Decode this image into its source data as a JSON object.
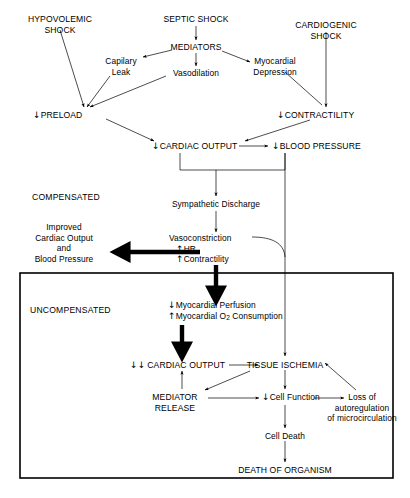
{
  "diagram": {
    "type": "flowchart",
    "background": "#ffffff",
    "line_color": "#000000"
  },
  "sections": {
    "compensated_label": "COMPENSATED",
    "uncompensated_label": "UNCOMPENSATED"
  },
  "nodes": {
    "hypovolemic_shock": "HYPOVOLEMIC\nSHOCK",
    "hypovolemic_shock_l1": "HYPOVOLEMIC",
    "hypovolemic_shock_l2": "SHOCK",
    "septic_shock": "SEPTIC SHOCK",
    "cardiogenic_shock_l1": "CARDIOGENIC",
    "cardiogenic_shock_l2": "SHOCK",
    "mediators": "MEDIATORS",
    "capillary_leak_l1": "Capilary",
    "capillary_leak_l2": "Leak",
    "vasodilation": "Vasodilation",
    "myocardial_depression_l1": "Myocardial",
    "myocardial_depression_l2": "Depression",
    "preload_arrow": "↓",
    "preload": "PRELOAD",
    "contractility_arrow": "↓",
    "contractility": "CONTRACTILITY",
    "cardiac_output_arrow": "↓",
    "cardiac_output": "CARDIAC OUTPUT",
    "blood_pressure_arrow": "↓",
    "blood_pressure": "BLOOD PRESSURE",
    "sympathetic_discharge": "Sympathetic Discharge",
    "improved_l1": "Improved",
    "improved_l2": "Cardiac Output",
    "improved_l3": "and",
    "improved_l4": "Blood Pressure",
    "vasoconstriction": "Vasoconstriction",
    "hr_arrow": "↑",
    "hr": "HR",
    "contractility2_arrow": "↑",
    "contractility2": "Contractility",
    "myocardial_perfusion_arrow": "↓",
    "myocardial_perfusion": "Myocardial Perfusion",
    "myocardial_o2_arrow": "↑",
    "myocardial_o2_pre": "Myocardial O",
    "myocardial_o2_sub": "2",
    "myocardial_o2_post": " Consumption",
    "cardiac_output2_arrow": "↓↓",
    "cardiac_output2": "CARDIAC OUTPUT",
    "tissue_ischemia": "TISSUE ISCHEMIA",
    "mediator_release_l1": "MEDIATOR",
    "mediator_release_l2": "RELEASE",
    "cell_function_arrow": "↓",
    "cell_function": "Cell Function",
    "loss_auto_l1": "Loss of",
    "loss_auto_l2": "autoregulation",
    "loss_auto_l3": "of microcirculation",
    "cell_death": "Cell Death",
    "death_of_organism": "DEATH OF ORGANISM"
  }
}
